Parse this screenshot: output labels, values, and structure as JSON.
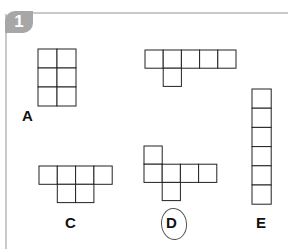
{
  "header": {
    "question_number": "1"
  },
  "colors": {
    "grid_stroke": "#222222",
    "badge_bg": "#a7a7a7",
    "frame": "#c9c9c9"
  },
  "shapes": [
    {
      "id": "A",
      "label": "A",
      "cell": 19,
      "cells": [
        [
          0,
          0
        ],
        [
          1,
          0
        ],
        [
          0,
          1
        ],
        [
          1,
          1
        ],
        [
          0,
          2
        ],
        [
          1,
          2
        ]
      ],
      "origin": [
        38,
        49
      ],
      "selected": false
    },
    {
      "id": "B",
      "label": "",
      "cell": 18.2,
      "cells": [
        [
          0,
          0
        ],
        [
          1,
          0
        ],
        [
          2,
          0
        ],
        [
          3,
          0
        ],
        [
          4,
          0
        ],
        [
          1,
          1
        ]
      ],
      "origin": [
        145,
        50
      ],
      "selected": false
    },
    {
      "id": "C",
      "label": "C",
      "cell": 18.3,
      "cells": [
        [
          0,
          0
        ],
        [
          1,
          0
        ],
        [
          2,
          0
        ],
        [
          3,
          0
        ],
        [
          1,
          1
        ],
        [
          2,
          1
        ]
      ],
      "origin": [
        39,
        166
      ],
      "selected": false
    },
    {
      "id": "D",
      "label": "D",
      "cell": 18.2,
      "cells": [
        [
          0,
          0
        ],
        [
          0,
          1
        ],
        [
          1,
          1
        ],
        [
          2,
          1
        ],
        [
          3,
          1
        ],
        [
          1,
          2
        ]
      ],
      "origin": [
        144,
        146
      ],
      "selected": true
    },
    {
      "id": "E",
      "label": "E",
      "cell": 19.2,
      "cells": [
        [
          0,
          0
        ],
        [
          0,
          1
        ],
        [
          0,
          2
        ],
        [
          0,
          3
        ],
        [
          0,
          4
        ],
        [
          0,
          5
        ]
      ],
      "origin": [
        252,
        89
      ],
      "selected": false
    }
  ],
  "labels": {
    "A": "A",
    "C": "C",
    "D": "D",
    "E": "E"
  },
  "answer_marked": "D"
}
